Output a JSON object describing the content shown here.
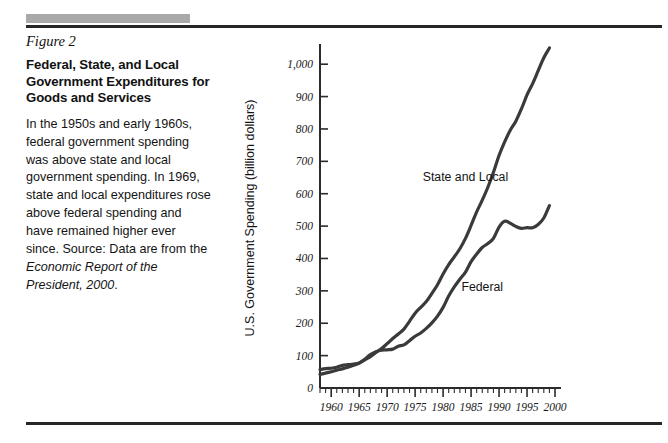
{
  "figure": {
    "label": "Figure 2",
    "title": "Federal, State, and Local Government Expenditures for Goods and Services",
    "caption_part1": "In the 1950s and early 1960s, federal government spending was above state and local government spending. In 1969, state and local expenditures rose above federal spending and have remained higher ever since. Source: Data are from the ",
    "caption_italic": "Economic Report of the President, 2000",
    "caption_part2": "."
  },
  "chart_data": {
    "type": "line",
    "title": "Federal, State, and Local Government Expenditures for Goods and Services",
    "xlabel": "Year",
    "ylabel": "U.S. Government Spending (billion dollars)",
    "xlim": [
      1958,
      2000
    ],
    "ylim": [
      0,
      1050
    ],
    "grid": false,
    "legend_position": "inline-annotation",
    "x_tick_labels": [
      "1960",
      "1965",
      "1970",
      "1975",
      "1980",
      "1985",
      "1990",
      "1995",
      "2000"
    ],
    "x_tick_values": [
      1960,
      1965,
      1970,
      1975,
      1980,
      1985,
      1990,
      1995,
      2000
    ],
    "x_minor_step": 1,
    "y_tick_labels": [
      "0",
      "100",
      "200",
      "300",
      "400",
      "500",
      "600",
      "700",
      "800",
      "900",
      "1,000"
    ],
    "y_tick_values": [
      0,
      100,
      200,
      300,
      400,
      500,
      600,
      700,
      800,
      900,
      1000
    ],
    "x": [
      1958,
      1959,
      1960,
      1961,
      1962,
      1963,
      1964,
      1965,
      1966,
      1967,
      1968,
      1969,
      1970,
      1971,
      1972,
      1973,
      1974,
      1975,
      1976,
      1977,
      1978,
      1979,
      1980,
      1981,
      1982,
      1983,
      1984,
      1985,
      1986,
      1987,
      1988,
      1989,
      1990,
      1991,
      1992,
      1993,
      1994,
      1995,
      1996,
      1997,
      1998,
      1999
    ],
    "series": [
      {
        "name": "State and Local",
        "label": "State and Local",
        "label_x": 1984,
        "label_y": 640,
        "color": "#3a3a3a",
        "values": [
          42,
          46,
          50,
          55,
          59,
          64,
          70,
          77,
          87,
          97,
          110,
          122,
          137,
          153,
          167,
          182,
          206,
          231,
          249,
          267,
          292,
          319,
          352,
          381,
          405,
          430,
          462,
          502,
          544,
          580,
          620,
          666,
          718,
          760,
          796,
          824,
          862,
          905,
          940,
          980,
          1020,
          1050
        ]
      },
      {
        "name": "Federal",
        "label": "Federal",
        "label_x": 1987,
        "label_y": 300,
        "color": "#3a3a3a",
        "values": [
          57,
          60,
          61,
          64,
          70,
          72,
          74,
          77,
          89,
          103,
          112,
          117,
          118,
          120,
          129,
          133,
          146,
          160,
          170,
          184,
          201,
          222,
          249,
          284,
          312,
          336,
          358,
          390,
          414,
          434,
          446,
          462,
          497,
          515,
          509,
          499,
          493,
          495,
          495,
          505,
          525,
          563
        ]
      }
    ],
    "annotations": [
      {
        "text": "State and Local",
        "x": 1984,
        "y": 640
      },
      {
        "text": "Federal",
        "x": 1987,
        "y": 300
      }
    ]
  }
}
